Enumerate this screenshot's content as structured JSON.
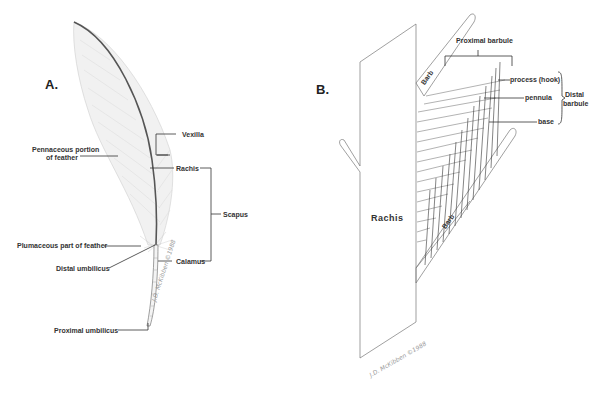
{
  "figure": {
    "panel_a": {
      "label": "A.",
      "labels": {
        "vexilla": "Vexilla",
        "pennaceous": "Pennaceous portion",
        "pennaceous_2": "of feather",
        "rachis": "Rachis",
        "scapus": "Scapus",
        "plumaceous": "Plumaceous part of feather",
        "distal_umbilicus": "Distal umbilicus",
        "calamus": "Calamus",
        "proximal_umbilicus": "Proximal umbilicus"
      },
      "signature": "J.D. McKibben ©1988"
    },
    "panel_b": {
      "label": "B.",
      "labels": {
        "proximal_barbule": "Proximal barbule",
        "barb_upper": "Barb",
        "barb_lower": "Barb",
        "process_hook": "process (hook)",
        "pennula": "pennula",
        "base": "base",
        "distal": "Distal",
        "barbule": "barbule",
        "rachis": "Rachis"
      },
      "signature": "J.D. McKibben ©1988"
    }
  }
}
